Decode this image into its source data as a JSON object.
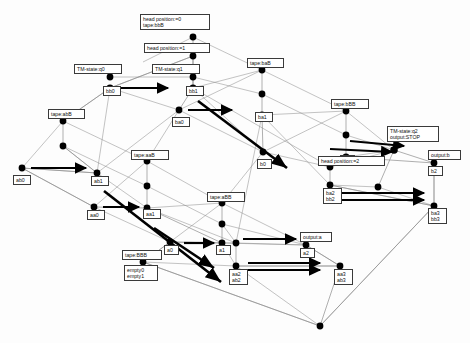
{
  "diagram": {
    "type": "state-transition-lattice",
    "background_color": "#fdfdfd",
    "node_color": "#000000",
    "thin_edge_color": "#8c8c8c",
    "bold_edge_color": "#000000",
    "label_border_color": "#3a3a3a",
    "label_fill_color": "#ffffff",
    "nodes": [
      {
        "id": "n_hp0",
        "x": 193,
        "y": 37,
        "r": 3.4,
        "label": "head position:=0\ntape:bbB",
        "label_x": 140,
        "label_y": 14,
        "label_w": 70,
        "label_h": 20,
        "anchor": "above"
      },
      {
        "id": "n_hp1",
        "x": 193,
        "y": 56,
        "r": 3.4,
        "label": "head position:=1",
        "label_x": 144,
        "label_y": 43,
        "label_w": 66,
        "label_h": 11,
        "anchor": "above"
      },
      {
        "id": "n_q1",
        "x": 193,
        "y": 77,
        "r": 3.4,
        "label": "TM-state:q1",
        "label_x": 152,
        "label_y": 64,
        "label_w": 48,
        "label_h": 11,
        "anchor": "above"
      },
      {
        "id": "n_bb1",
        "x": 193,
        "y": 88,
        "r": 3.4,
        "label": "bb1",
        "label_x": 186,
        "label_y": 86,
        "label_w": 18,
        "label_h": 10,
        "anchor": "below"
      },
      {
        "id": "n_q0",
        "x": 110,
        "y": 77,
        "r": 3.4,
        "label": "TM-state:q0",
        "label_x": 74,
        "label_y": 64,
        "label_w": 48,
        "label_h": 11,
        "anchor": "above"
      },
      {
        "id": "n_bb0",
        "x": 110,
        "y": 88,
        "r": 3.4,
        "label": "bb0",
        "label_x": 103,
        "label_y": 86,
        "label_w": 18,
        "label_h": 10,
        "anchor": "below"
      },
      {
        "id": "n_baB",
        "x": 262,
        "y": 70,
        "r": 3.4,
        "label": "tape:baB",
        "label_x": 247,
        "label_y": 58,
        "label_w": 37,
        "label_h": 11,
        "anchor": "above"
      },
      {
        "id": "n_ba_mid",
        "x": 262,
        "y": 94,
        "r": 3.4,
        "label": "",
        "label_x": 0,
        "label_y": 0,
        "label_w": 0,
        "label_h": 0,
        "anchor": "none"
      },
      {
        "id": "n_ba1",
        "x": 262,
        "y": 115,
        "r": 3.4,
        "label": "ba1",
        "label_x": 255,
        "label_y": 112,
        "label_w": 18,
        "label_h": 10,
        "anchor": "below"
      },
      {
        "id": "n_ba0",
        "x": 179,
        "y": 110,
        "r": 3.4,
        "label": "ba0",
        "label_x": 172,
        "label_y": 117,
        "label_w": 18,
        "label_h": 10,
        "anchor": "below"
      },
      {
        "id": "n_bBB",
        "x": 346,
        "y": 111,
        "r": 3.4,
        "label": "tape:bBB",
        "label_x": 331,
        "label_y": 99,
        "label_w": 38,
        "label_h": 11,
        "anchor": "above"
      },
      {
        "id": "n_bBB_mid",
        "x": 346,
        "y": 135,
        "r": 3.4,
        "label": "",
        "label_x": 0,
        "label_y": 0,
        "label_w": 0,
        "label_h": 0,
        "anchor": "none"
      },
      {
        "id": "n_b1",
        "x": 346,
        "y": 157,
        "r": 3.4,
        "label": "b1",
        "label_x": 340,
        "label_y": 155,
        "label_w": 15,
        "label_h": 10,
        "anchor": "below"
      },
      {
        "id": "n_b0",
        "x": 263,
        "y": 152,
        "r": 3.4,
        "label": "b0",
        "label_x": 257,
        "label_y": 159,
        "label_w": 15,
        "label_h": 10,
        "anchor": "below"
      },
      {
        "id": "n_abB",
        "x": 63,
        "y": 121,
        "r": 3.4,
        "label": "tape:abB",
        "label_x": 48,
        "label_y": 109,
        "label_w": 37,
        "label_h": 11,
        "anchor": "above"
      },
      {
        "id": "n_ab_mid",
        "x": 63,
        "y": 146,
        "r": 3.4,
        "label": "",
        "label_x": 0,
        "label_y": 0,
        "label_w": 0,
        "label_h": 0,
        "anchor": "none"
      },
      {
        "id": "n_ab1",
        "x": 97,
        "y": 173,
        "r": 3.4,
        "label": "ab1",
        "label_x": 91,
        "label_y": 176,
        "label_w": 18,
        "label_h": 10,
        "anchor": "below"
      },
      {
        "id": "n_ab0",
        "x": 22,
        "y": 168,
        "r": 3.4,
        "label": "ab0",
        "label_x": 13,
        "label_y": 175,
        "label_w": 18,
        "label_h": 10,
        "anchor": "below"
      },
      {
        "id": "n_aaB",
        "x": 147,
        "y": 161,
        "r": 3.4,
        "label": "tape:aaB",
        "label_x": 131,
        "label_y": 150,
        "label_w": 38,
        "label_h": 11,
        "anchor": "above"
      },
      {
        "id": "n_aa_mid",
        "x": 147,
        "y": 186,
        "r": 3.4,
        "label": "",
        "label_x": 0,
        "label_y": 0,
        "label_w": 0,
        "label_h": 0,
        "anchor": "none"
      },
      {
        "id": "n_aa1",
        "x": 147,
        "y": 208,
        "r": 3.4,
        "label": "aa1",
        "label_x": 143,
        "label_y": 209,
        "label_w": 18,
        "label_h": 10,
        "anchor": "below"
      },
      {
        "id": "n_aa0",
        "x": 94,
        "y": 207,
        "r": 3.4,
        "label": "aa0",
        "label_x": 87,
        "label_y": 210,
        "label_w": 18,
        "label_h": 10,
        "anchor": "below"
      },
      {
        "id": "n_aBB",
        "x": 222,
        "y": 203,
        "r": 3.4,
        "label": "tape:aBB",
        "label_x": 207,
        "label_y": 192,
        "label_w": 38,
        "label_h": 11,
        "anchor": "above"
      },
      {
        "id": "n_aBB_mid",
        "x": 222,
        "y": 224,
        "r": 3.4,
        "label": "",
        "label_x": 0,
        "label_y": 0,
        "label_w": 0,
        "label_h": 0,
        "anchor": "none"
      },
      {
        "id": "n_a1",
        "x": 222,
        "y": 243,
        "r": 3.4,
        "label": "a1",
        "label_x": 216,
        "label_y": 245,
        "label_w": 15,
        "label_h": 10,
        "anchor": "below"
      },
      {
        "id": "n_a0",
        "x": 170,
        "y": 242,
        "r": 3.4,
        "label": "a0",
        "label_x": 164,
        "label_y": 245,
        "label_w": 15,
        "label_h": 10,
        "anchor": "below"
      },
      {
        "id": "n_BBB",
        "x": 143,
        "y": 262,
        "r": 3.4,
        "label": "tape:BBB",
        "label_x": 122,
        "label_y": 250,
        "label_w": 40,
        "label_h": 11,
        "anchor": "above"
      },
      {
        "id": "n_empty",
        "x": 143,
        "y": 270,
        "r": 0,
        "label": "empty0\nempty1",
        "label_x": 124,
        "label_y": 265,
        "label_w": 34,
        "label_h": 19,
        "anchor": "below"
      },
      {
        "id": "n_q2",
        "x": 394,
        "y": 150,
        "r": 3.8,
        "label": "TM-state:q2\noutput:STOP",
        "label_x": 387,
        "label_y": 126,
        "label_w": 52,
        "label_h": 20,
        "anchor": "above"
      },
      {
        "id": "n_b2",
        "x": 434,
        "y": 163,
        "r": 3.4,
        "label": "b2",
        "label_x": 428,
        "label_y": 166,
        "label_w": 15,
        "label_h": 10,
        "anchor": "below"
      },
      {
        "id": "n_outb",
        "x": 434,
        "y": 157,
        "r": 0,
        "label": "output:b",
        "label_x": 428,
        "label_y": 150,
        "label_w": 33,
        "label_h": 11,
        "anchor": "above"
      },
      {
        "id": "n_hp2",
        "x": 330,
        "y": 167,
        "r": 3.4,
        "label": "head position:=2",
        "label_x": 318,
        "label_y": 156,
        "label_w": 67,
        "label_h": 11,
        "anchor": "above"
      },
      {
        "id": "n_bb2",
        "x": 330,
        "y": 185,
        "r": 3.4,
        "label": "ba2\nbb2",
        "label_x": 323,
        "label_y": 188,
        "label_w": 19,
        "label_h": 19,
        "anchor": "below"
      },
      {
        "id": "n_bb3",
        "x": 434,
        "y": 206,
        "r": 3.4,
        "label": "ba3\nbb3",
        "label_x": 428,
        "label_y": 208,
        "label_w": 19,
        "label_h": 19,
        "anchor": "below"
      },
      {
        "id": "n_mid_r",
        "x": 378,
        "y": 187,
        "r": 3.4,
        "label": "",
        "label_x": 0,
        "label_y": 0,
        "label_w": 0,
        "label_h": 0,
        "anchor": "none"
      },
      {
        "id": "n_a2",
        "x": 306,
        "y": 245,
        "r": 3.4,
        "label": "a2",
        "label_x": 300,
        "label_y": 248,
        "label_w": 15,
        "label_h": 10,
        "anchor": "below"
      },
      {
        "id": "n_outa",
        "x": 306,
        "y": 239,
        "r": 0,
        "label": "output:a",
        "label_x": 300,
        "label_y": 232,
        "label_w": 32,
        "label_h": 11,
        "anchor": "above"
      },
      {
        "id": "n_ab2",
        "x": 236,
        "y": 266,
        "r": 3.4,
        "label": "aa2\nab2",
        "label_x": 229,
        "label_y": 269,
        "label_w": 19,
        "label_h": 19,
        "anchor": "below"
      },
      {
        "id": "n_ab3",
        "x": 340,
        "y": 266,
        "r": 3.4,
        "label": "aa3\nab3",
        "label_x": 334,
        "label_y": 269,
        "label_w": 19,
        "label_h": 19,
        "anchor": "below"
      },
      {
        "id": "n_low_mid",
        "x": 236,
        "y": 243,
        "r": 3.4,
        "label": "",
        "label_x": 0,
        "label_y": 0,
        "label_w": 0,
        "label_h": 0,
        "anchor": "none"
      },
      {
        "id": "n_bottom",
        "x": 320,
        "y": 326,
        "r": 3.4,
        "label": "",
        "label_x": 0,
        "label_y": 0,
        "label_w": 0,
        "label_h": 0,
        "anchor": "none"
      }
    ],
    "thin_edges": [
      [
        "n_hp0",
        "n_hp1"
      ],
      [
        "n_hp1",
        "n_q1"
      ],
      [
        "n_q1",
        "n_bb1"
      ],
      [
        "n_bb0",
        "n_abB"
      ],
      [
        "n_bb0",
        "n_hp1"
      ],
      [
        "n_bb1",
        "n_hp1"
      ],
      [
        "n_baB",
        "n_ba_mid"
      ],
      [
        "n_ba_mid",
        "n_ba1"
      ],
      [
        "n_bBB",
        "n_bBB_mid"
      ],
      [
        "n_bBB_mid",
        "n_b1"
      ],
      [
        "n_abB",
        "n_ab_mid"
      ],
      [
        "n_ab_mid",
        "n_ab1"
      ],
      [
        "n_aaB",
        "n_aa_mid"
      ],
      [
        "n_aa_mid",
        "n_aa1"
      ],
      [
        "n_aBB",
        "n_aBB_mid"
      ],
      [
        "n_aBB_mid",
        "n_a1"
      ],
      [
        "n_hp2",
        "n_bb2"
      ],
      [
        "n_low_mid",
        "n_ab2"
      ],
      [
        "n_ab0",
        "n_ab1"
      ],
      [
        "n_ab0",
        "n_aa0"
      ],
      [
        "n_aa0",
        "n_aa1"
      ],
      [
        "n_aa1",
        "n_a1"
      ],
      [
        "n_a0",
        "n_a1"
      ],
      [
        "n_a0",
        "n_BBB"
      ],
      [
        "n_bb1",
        "n_ba0"
      ],
      [
        "n_ba1",
        "n_b0"
      ],
      [
        "n_b1",
        "n_b2"
      ],
      [
        "n_bb2",
        "n_bb3"
      ],
      [
        "n_ab2",
        "n_ab3"
      ],
      [
        "n_a2",
        "n_ab3"
      ],
      [
        "n_b2",
        "n_bb3"
      ],
      [
        "n_q2",
        "n_b2"
      ],
      [
        "n_mid_r",
        "n_q2"
      ],
      [
        "n_ab3",
        "n_bottom"
      ],
      [
        "n_bb3",
        "n_bottom"
      ],
      [
        "n_BBB",
        "n_bottom"
      ]
    ],
    "bold_arrows": [
      {
        "from": [
          119,
          88
        ],
        "to": [
          168,
          88
        ]
      },
      {
        "from": [
          188,
          110
        ],
        "to": [
          232,
          110
        ]
      },
      {
        "from": [
          31,
          168
        ],
        "to": [
          86,
          168
        ]
      },
      {
        "from": [
          103,
          207
        ],
        "to": [
          139,
          207
        ]
      },
      {
        "from": [
          184,
          243
        ],
        "to": [
          214,
          243
        ]
      },
      {
        "from": [
          248,
          263
        ],
        "to": [
          320,
          263
        ]
      },
      {
        "from": [
          248,
          270
        ],
        "to": [
          320,
          270
        ]
      },
      {
        "from": [
          340,
          193
        ],
        "to": [
          424,
          193
        ]
      },
      {
        "from": [
          340,
          200
        ],
        "to": [
          424,
          200
        ]
      },
      {
        "from": [
          243,
          239
        ],
        "to": [
          296,
          239
        ]
      },
      {
        "from": [
          330,
          149
        ],
        "to": [
          392,
          152
        ]
      },
      {
        "from": [
          350,
          141
        ],
        "to": [
          404,
          146
        ]
      }
    ],
    "bold_lines": [
      {
        "from": [
          198,
          101
        ],
        "to": [
          287,
          168
        ]
      },
      {
        "from": [
          104,
          191
        ],
        "to": [
          221,
          282
        ]
      },
      {
        "from": [
          154,
          228
        ],
        "to": [
          214,
          268
        ]
      }
    ]
  }
}
